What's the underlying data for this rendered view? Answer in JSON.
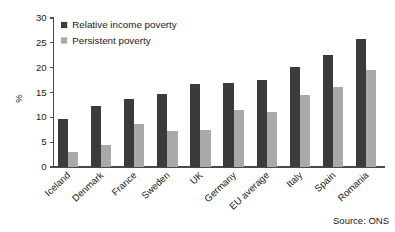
{
  "chart_data": {
    "type": "bar",
    "title": "",
    "subtitle": "",
    "xlabel": "",
    "ylabel": "%",
    "ylim": [
      0,
      30
    ],
    "yticks": [
      0,
      5,
      10,
      15,
      20,
      25,
      30
    ],
    "grid": false,
    "legend_position": "top-left",
    "categories": [
      "Iceland",
      "Denmark",
      "France",
      "Sweden",
      "UK",
      "Germany",
      "EU average",
      "Italy",
      "Spain",
      "Romania"
    ],
    "series": [
      {
        "name": "Relative income poverty",
        "color": "#3b3b3b",
        "values": [
          9.7,
          12.3,
          13.7,
          14.6,
          16.8,
          16.9,
          17.5,
          20.2,
          22.5,
          25.8
        ]
      },
      {
        "name": "Persistent poverty",
        "color": "#a9a9a9",
        "values": [
          3.0,
          4.4,
          8.6,
          7.2,
          7.5,
          11.5,
          11.1,
          14.5,
          16.1,
          19.6
        ]
      }
    ],
    "annotations": [
      "Source: ONS"
    ]
  },
  "figure": {
    "source_note": "Source: ONS",
    "axis_color": "#4a4a4a",
    "background": "#ffffff"
  }
}
